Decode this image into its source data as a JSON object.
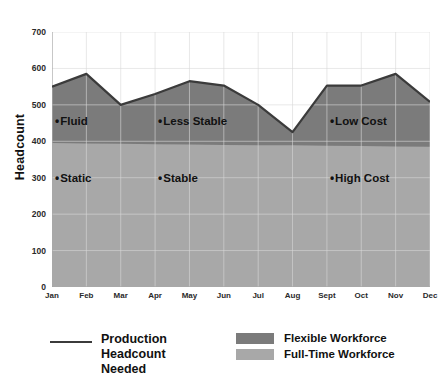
{
  "chart_data": {
    "type": "area",
    "title": "",
    "xlabel": "",
    "ylabel": "Headcount",
    "ylim": [
      0,
      700
    ],
    "ytick_values": [
      0,
      100,
      200,
      300,
      400,
      500,
      600,
      700
    ],
    "ytick_labels": [
      "0",
      "100",
      "200",
      "300",
      "400",
      "500",
      "600",
      "700"
    ],
    "grid": true,
    "legend_position": "bottom",
    "categories": [
      "Jan",
      "Feb",
      "Mar",
      "Apr",
      "May",
      "Jun",
      "Jul",
      "Aug",
      "Sept",
      "Oct",
      "Nov",
      "Dec"
    ],
    "series": [
      {
        "name": "Production Headcount Needed",
        "type": "line",
        "color": "#3b3b3b",
        "values": [
          550,
          585,
          500,
          530,
          565,
          553,
          500,
          425,
          553,
          553,
          585,
          508
        ]
      },
      {
        "name": "Full-Time Workforce",
        "type": "area",
        "color": "#a0a0a0",
        "values": [
          395,
          394,
          393,
          392,
          391,
          390,
          389,
          389,
          388,
          387,
          386,
          385
        ]
      },
      {
        "name": "Flexible Workforce",
        "type": "area",
        "color": "#7b7b7b",
        "values": [
          550,
          585,
          500,
          530,
          565,
          553,
          500,
          425,
          553,
          553,
          585,
          508
        ]
      }
    ],
    "annotations": [
      {
        "text": "Fluid",
        "dot": "•",
        "x_category": "Jan",
        "y_value": 455
      },
      {
        "text": "Less Stable",
        "dot": "•",
        "x_category": "Apr",
        "y_value": 455
      },
      {
        "text": "Low Cost",
        "dot": "•",
        "x_category": "Sept",
        "y_value": 455
      },
      {
        "text": "Static",
        "dot": "•",
        "x_category": "Jan",
        "y_value": 300
      },
      {
        "text": "Stable",
        "dot": "•",
        "x_category": "Apr",
        "y_value": 300
      },
      {
        "text": "High Cost",
        "dot": "•",
        "x_category": "Sept",
        "y_value": 300
      }
    ]
  },
  "axis": {
    "y_title": "Headcount"
  },
  "legend": {
    "line_entry": {
      "label_line1": "Production",
      "label_line2": "Headcount",
      "label_line3": "Needed",
      "color": "#3b3b3b"
    },
    "area_entries": [
      {
        "label": "Flexible Workforce",
        "color": "#7b7b7b"
      },
      {
        "label": "Full-Time Workforce",
        "color": "#a8a8a8"
      }
    ]
  },
  "colors": {
    "flexible_band": "#7b7b7b",
    "fulltime_band": "#a8a8a8",
    "line": "#3b3b3b",
    "grid": "#d8d8d8",
    "axis": "#9a9a9a",
    "text": "#111111",
    "background": "#ffffff"
  }
}
